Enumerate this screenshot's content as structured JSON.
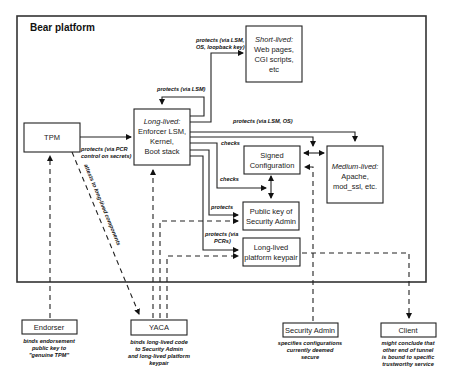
{
  "diagram": {
    "title": "Bear platform",
    "boxes": {
      "tpm": {
        "lines": [
          "TPM"
        ]
      },
      "long_lived": {
        "italic_head": "Long-lived:",
        "lines": [
          "Enforcer LSM,",
          "Kernel,",
          "Boot stack"
        ]
      },
      "short_lived": {
        "italic_head": "Short-lived:",
        "lines": [
          "Web pages,",
          "CGI scripts,",
          "etc"
        ]
      },
      "signed_config": {
        "lines": [
          "Signed",
          "Configuration"
        ]
      },
      "medium_lived": {
        "italic_head": "Medium-lived:",
        "lines": [
          "Apache,",
          "mod_ssl, etc."
        ]
      },
      "pubkey_admin": {
        "lines": [
          "Public key of",
          "Security Admin"
        ]
      },
      "platform_keypair": {
        "lines": [
          "Long-lived",
          "platform keypair"
        ]
      },
      "endorser": {
        "lines": [
          "Endorser"
        ]
      },
      "yaca": {
        "lines": [
          "YACA"
        ]
      },
      "security_admin": {
        "lines": [
          "Security Admin"
        ]
      },
      "client": {
        "lines": [
          "Client"
        ]
      }
    },
    "edge_labels": {
      "protects_lsm_os_loopback": [
        "protects (via LSM,",
        "OS, loopback key)"
      ],
      "protects_lsm": "protects (via LSM)",
      "protects_lsm_os": "protects (via LSM, OS)",
      "protects_pcr": [
        "protects (via PCR",
        "control on secrets)"
      ],
      "checks_1": "checks",
      "checks_2": "checks",
      "protects": "protects",
      "protects_pcrs": [
        "protects (via",
        "PCRs)"
      ],
      "attests": "attests to long-lived components"
    },
    "captions": {
      "endorser": [
        "binds endorsement",
        "public key to",
        "\"genuine TPM\""
      ],
      "yaca": [
        "binds long-lived code",
        "to Security Admin",
        "and long-lived platform",
        "keypair"
      ],
      "security_admin": [
        "specifies configurations",
        "currently deemed",
        "secure"
      ],
      "client": [
        "might conclude that",
        "other end of tunnel",
        "is bound to specific",
        "trustworthy service"
      ]
    }
  }
}
